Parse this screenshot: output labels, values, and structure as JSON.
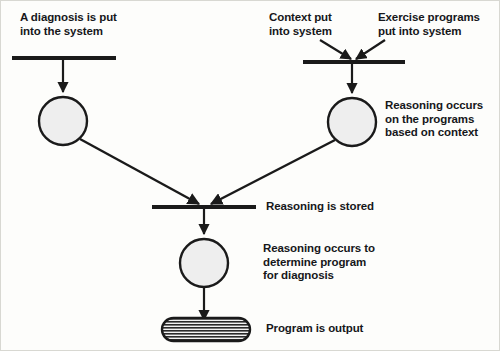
{
  "diagram": {
    "type": "flow-diagram",
    "background_color": "#fdfdfb",
    "stroke_color": "#1a1a1a",
    "node_fill_color": "#eeeeee",
    "labels": {
      "diagnosis_input": "A diagnosis is put\ninto the system",
      "context_input": "Context put\ninto system",
      "exercise_input": "Exercise programs\nput into system",
      "reasoning_programs": "Reasoning occurs\non the programs\nbased on context",
      "reasoning_stored": "Reasoning is stored",
      "reasoning_determine": "Reasoning occurs to\ndetermine program\nfor diagnosis",
      "program_output": "Program is output"
    },
    "nodes": [
      {
        "id": "bar-diagnosis",
        "shape": "bar",
        "x1": 12,
        "x2": 116,
        "y": 58
      },
      {
        "id": "bar-context-exercise",
        "shape": "bar",
        "x1": 303,
        "x2": 405,
        "y": 62
      },
      {
        "id": "bar-stored",
        "shape": "bar",
        "x1": 152,
        "x2": 256,
        "y": 207
      },
      {
        "id": "circle-diagnosis",
        "shape": "circle",
        "cx": 63,
        "cy": 121,
        "r": 24
      },
      {
        "id": "circle-programs",
        "shape": "circle",
        "cx": 352,
        "cy": 122,
        "r": 24
      },
      {
        "id": "circle-determine",
        "shape": "circle",
        "cx": 204,
        "cy": 263,
        "r": 24
      },
      {
        "id": "stadium-output",
        "shape": "stadium",
        "x": 162,
        "y": 318,
        "w": 88,
        "h": 23,
        "hatch": "horizontal-lines"
      }
    ],
    "edges": [
      {
        "id": "edge-bar-to-circle-diagnosis",
        "from": "bar-diagnosis",
        "to": "circle-diagnosis"
      },
      {
        "id": "edge-context-to-bar",
        "from": "context_input",
        "to": "bar-context-exercise"
      },
      {
        "id": "edge-exercise-to-bar",
        "from": "exercise_input",
        "to": "bar-context-exercise"
      },
      {
        "id": "edge-bar-to-circle-programs",
        "from": "bar-context-exercise",
        "to": "circle-programs"
      },
      {
        "id": "edge-circle-diagnosis-to-bar-stored",
        "from": "circle-diagnosis",
        "to": "bar-stored"
      },
      {
        "id": "edge-circle-programs-to-bar-stored",
        "from": "circle-programs",
        "to": "bar-stored"
      },
      {
        "id": "edge-bar-stored-to-circle-determine",
        "from": "bar-stored",
        "to": "circle-determine"
      },
      {
        "id": "edge-circle-determine-to-output",
        "from": "circle-determine",
        "to": "stadium-output"
      }
    ]
  }
}
